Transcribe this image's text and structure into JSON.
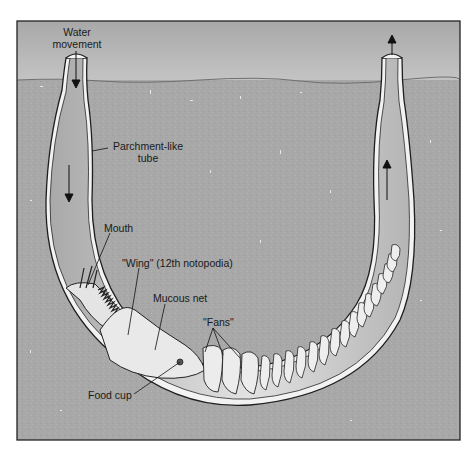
{
  "diagram": {
    "colors": {
      "water": "#b4b4b4",
      "sediment": "#a9a9a9",
      "tube_wall": "#f4f4f4",
      "tube_lumen": "#c9c9c9",
      "worm_body": "#e6e6e6",
      "outline": "#1e1e1e",
      "frame": "#222222"
    },
    "labels": {
      "water_movement_line1": "Water",
      "water_movement_line2": "movement",
      "parchment_line1": "Parchment-like",
      "parchment_line2": "tube",
      "mouth": "Mouth",
      "wing": "\"Wing\" (12th notopodia)",
      "mucous_net": "Mucous net",
      "fans": "\"Fans\"",
      "food_cup": "Food cup"
    },
    "flow_arrows": [
      {
        "position": "left tube top",
        "direction": "down"
      },
      {
        "position": "left tube middle",
        "direction": "down"
      },
      {
        "position": "right tube middle",
        "direction": "up"
      },
      {
        "position": "right tube top",
        "direction": "up"
      }
    ]
  }
}
